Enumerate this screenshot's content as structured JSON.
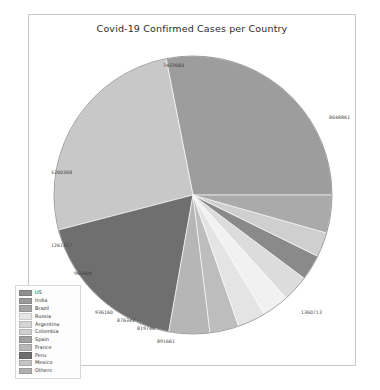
{
  "chart_data": {
    "type": "pie",
    "title": "Covid-19 Confirmed Cases per Country",
    "xlabel": "",
    "ylabel": "",
    "legend_position": "lower-left",
    "grid": false,
    "categories": [
      "US",
      "India",
      "Brazil",
      "Russia",
      "Argentina",
      "Colombia",
      "Spain",
      "France",
      "Peru",
      "Mexico",
      "Others"
    ],
    "labels": [
      "8048861",
      "1360712",
      "891661",
      "819740",
      "876342",
      "936160",
      "965609",
      "1261317",
      "5200308",
      "7432680",
      "7432680"
    ],
    "slices": [
      {
        "name": "US",
        "value": 8048861,
        "label": "8048861",
        "color": "#9d9d9d"
      },
      {
        "name": "India",
        "value": 7432680,
        "label": "7432680",
        "color": "#c8c8c8"
      },
      {
        "name": "Brazil",
        "value": 5200308,
        "label": "5200308",
        "color": "#6f6f6f"
      },
      {
        "name": "Russia",
        "value": 1360712,
        "label": "1360712",
        "color": "#b6b6b6"
      },
      {
        "name": "Argentina",
        "value": 965609,
        "label": "965609",
        "color": "#bdbdbd"
      },
      {
        "name": "Colombia",
        "value": 936160,
        "label": "936160",
        "color": "#e4e4e4"
      },
      {
        "name": "Spain",
        "value": 891661,
        "label": "891661",
        "color": "#f1f1f1"
      },
      {
        "name": "France",
        "value": 876342,
        "label": "876342",
        "color": "#dcdcdc"
      },
      {
        "name": "Peru",
        "value": 849371,
        "label": "",
        "color": "#8a8a8a"
      },
      {
        "name": "Mexico",
        "value": 819740,
        "label": "819740",
        "color": "#cfcfcf"
      },
      {
        "name": "Others",
        "value": 1261317,
        "label": "1261317",
        "color": "#aaaaaa"
      }
    ],
    "visible_data_labels": [
      {
        "text": "7432680",
        "x": 134,
        "y": 48
      },
      {
        "text": "8048861",
        "x": 300,
        "y": 100
      },
      {
        "text": "1360712",
        "x": 272,
        "y": 295
      },
      {
        "text": "891661",
        "x": 128,
        "y": 324
      },
      {
        "text": "819740",
        "x": 108,
        "y": 311
      },
      {
        "text": "876342",
        "x": 88,
        "y": 303
      },
      {
        "text": "936160",
        "x": 66,
        "y": 295
      },
      {
        "text": "965609",
        "x": 45,
        "y": 256
      },
      {
        "text": "1261317",
        "x": 22,
        "y": 228
      },
      {
        "text": "5200308",
        "x": 22,
        "y": 155
      }
    ]
  },
  "legend": {
    "items": [
      {
        "label": "US",
        "color": "#8f8f8f"
      },
      {
        "label": "India",
        "color": "#9a9a9a"
      },
      {
        "label": "Brazil",
        "color": "#a5a5a5"
      },
      {
        "label": "Russia",
        "color": "#e6e6e6"
      },
      {
        "label": "Argentina",
        "color": "#d4d4d4"
      },
      {
        "label": "Colombia",
        "color": "#cfcfcf"
      },
      {
        "label": "Spain",
        "color": "#a0a0a0"
      },
      {
        "label": "France",
        "color": "#b8b8b8"
      },
      {
        "label": "Peru",
        "color": "#6e6e6e"
      },
      {
        "label": "Mexico",
        "color": "#c4c4c4"
      },
      {
        "label": "Others",
        "color": "#b0b0b0"
      }
    ]
  }
}
